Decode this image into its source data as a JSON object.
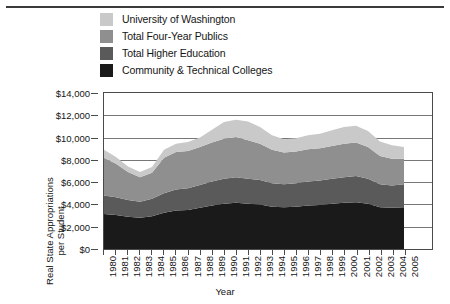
{
  "axis": {
    "y_title_line1": "Real State Appropriations",
    "y_title_line2": "per Student",
    "x_title": "Year",
    "y_ticks": [
      "$0",
      "$2,000",
      "$4,000",
      "$6,000",
      "$8,000",
      "$10,000",
      "$12,000",
      "$14,000"
    ]
  },
  "legend": [
    {
      "label": "University of Washington",
      "color": "#c9c9c9"
    },
    {
      "label": "Total Four-Year Publics",
      "color": "#8f8f8f"
    },
    {
      "label": "Total Higher Education",
      "color": "#5a5a5a"
    },
    {
      "label": "Community & Technical Colleges",
      "color": "#1a1a1a"
    }
  ],
  "chart_data": {
    "type": "area",
    "stacked": true,
    "title": "",
    "xlabel": "Year",
    "ylabel": "Real State Appropriations per Student",
    "ylim": [
      0,
      14000
    ],
    "ytick_step": 2000,
    "grid": true,
    "legend_position": "top",
    "categories": [
      "1980",
      "1981",
      "1982",
      "1983",
      "1984",
      "1985",
      "1986",
      "1987",
      "1988",
      "1989",
      "1990",
      "1991",
      "1992",
      "1993",
      "1994",
      "1995",
      "1996",
      "1997",
      "1998",
      "1999",
      "2000",
      "2001",
      "2002",
      "2003",
      "2004",
      "2005"
    ],
    "series": [
      {
        "name": "Community & Technical Colleges",
        "color": "#1a1a1a",
        "values": [
          3150,
          3050,
          2900,
          2800,
          2950,
          3250,
          3450,
          3500,
          3700,
          3900,
          4050,
          4150,
          4050,
          4000,
          3800,
          3750,
          3800,
          3900,
          3950,
          4050,
          4150,
          4200,
          4050,
          3750,
          3700,
          3750
        ]
      },
      {
        "name": "Total Higher Education",
        "color": "#5a5a5a",
        "values": [
          1650,
          1600,
          1500,
          1450,
          1550,
          1750,
          1900,
          1950,
          2050,
          2150,
          2250,
          2300,
          2250,
          2200,
          2100,
          2050,
          2100,
          2150,
          2200,
          2250,
          2300,
          2350,
          2250,
          2050,
          2000,
          2050
        ]
      },
      {
        "name": "Total Four-Year Publics",
        "color": "#8f8f8f",
        "values": [
          3400,
          3000,
          2500,
          2200,
          2350,
          3200,
          3350,
          3350,
          3400,
          3500,
          3600,
          3600,
          3450,
          3250,
          3000,
          2850,
          2850,
          2900,
          2900,
          2950,
          3000,
          3000,
          2850,
          2550,
          2400,
          2300
        ]
      },
      {
        "name": "University of Washington",
        "color": "#c9c9c9",
        "values": [
          700,
          600,
          500,
          450,
          500,
          700,
          750,
          800,
          850,
          1150,
          1500,
          1550,
          1700,
          1500,
          1300,
          1200,
          1200,
          1250,
          1300,
          1400,
          1500,
          1500,
          1450,
          1300,
          1200,
          1050
        ]
      }
    ]
  }
}
